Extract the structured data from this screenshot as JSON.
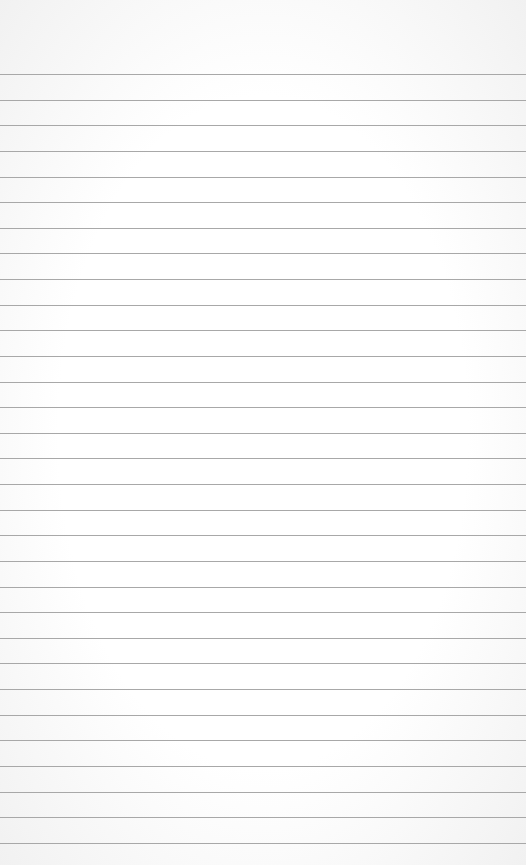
{
  "paper": {
    "type": "lined-paper",
    "background_color": "#ffffff",
    "line_color": "#a8a8a8",
    "first_line_y": 74,
    "line_spacing": 25.63,
    "line_count": 31
  }
}
